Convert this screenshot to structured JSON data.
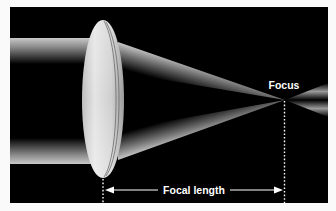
{
  "diagram": {
    "labels": {
      "focus": "Focus",
      "focal_length": "Focal length"
    },
    "colors": {
      "page_background": "#fafafa",
      "frame_background": "#000000",
      "beam": "#cfcfcf",
      "lens": "#d8d8d8",
      "annotation": "#ffffff"
    },
    "elements": {
      "incoming_beam": "collimated hollow light beam entering from left",
      "lens": "convex lens",
      "converging_beam": "light converging to focal point",
      "diverging_beam": "light diverging past focal point",
      "focus_marker": "dotted vertical line at focal point",
      "lens_marker": "dotted vertical line at lens center",
      "focal_length_arrow": "double-headed arrow between lens and focus"
    }
  }
}
